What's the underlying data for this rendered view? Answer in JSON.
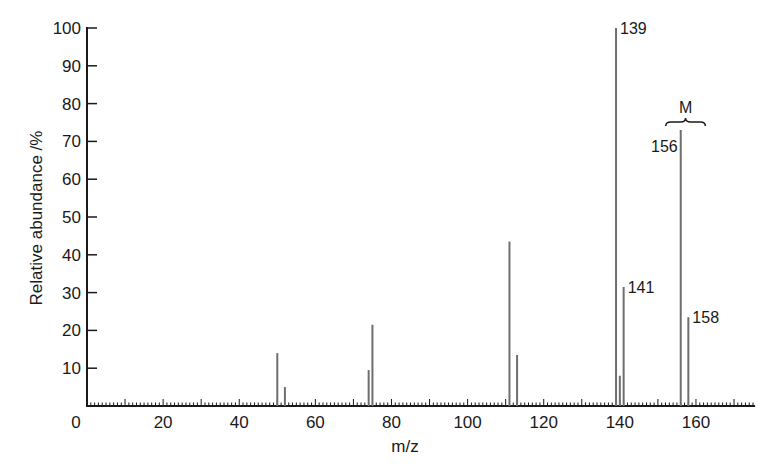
{
  "chart_data": {
    "type": "bar",
    "title": "",
    "xlabel": "m/z",
    "ylabel": "Relative abundance /%",
    "xlim": [
      0,
      175
    ],
    "ylim": [
      0,
      100
    ],
    "x_ticks": [
      0,
      20,
      40,
      60,
      80,
      100,
      120,
      140,
      160
    ],
    "y_ticks": [
      10,
      20,
      30,
      40,
      50,
      60,
      70,
      80,
      90,
      100
    ],
    "y_zero_label": "0",
    "grid": false,
    "legend": null,
    "peaks": [
      {
        "mz": 50,
        "abundance": 14
      },
      {
        "mz": 52,
        "abundance": 5
      },
      {
        "mz": 74,
        "abundance": 9.5
      },
      {
        "mz": 75,
        "abundance": 21.5
      },
      {
        "mz": 111,
        "abundance": 43.5
      },
      {
        "mz": 113,
        "abundance": 13.5
      },
      {
        "mz": 139,
        "abundance": 100,
        "label": "139"
      },
      {
        "mz": 140,
        "abundance": 8
      },
      {
        "mz": 141,
        "abundance": 31.5,
        "label": "141"
      },
      {
        "mz": 156,
        "abundance": 73,
        "label": "156"
      },
      {
        "mz": 158,
        "abundance": 23.5,
        "label": "158"
      }
    ],
    "annotations": [
      {
        "text": "M",
        "type": "brace",
        "spans_mz": [
          156,
          158
        ]
      }
    ]
  },
  "colors": {
    "axis": "#1a1a1a",
    "peak": "#6e6e6e"
  }
}
